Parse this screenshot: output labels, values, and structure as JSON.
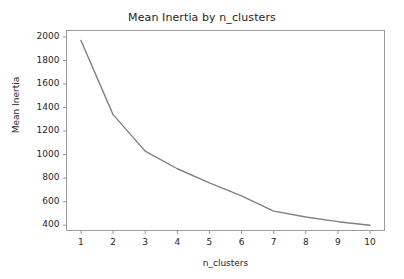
{
  "chart_data": {
    "type": "line",
    "title": "Mean Inertia by n_clusters",
    "xlabel": "n_clusters",
    "ylabel": "Mean Inertia",
    "x": [
      1,
      2,
      3,
      4,
      5,
      6,
      7,
      8,
      9,
      10
    ],
    "values": [
      1970,
      1340,
      1030,
      880,
      760,
      650,
      520,
      470,
      430,
      400
    ],
    "categories": [
      "1",
      "2",
      "3",
      "4",
      "5",
      "6",
      "7",
      "8",
      "9",
      "10"
    ],
    "series": [
      {
        "name": "Mean Inertia",
        "values": [
          1970,
          1340,
          1030,
          880,
          760,
          650,
          520,
          470,
          430,
          400
        ],
        "color": "#808080"
      }
    ],
    "xlim": [
      0.55,
      10.45
    ],
    "ylim": [
      355,
      2055
    ],
    "xticks": [
      1,
      2,
      3,
      4,
      5,
      6,
      7,
      8,
      9,
      10
    ],
    "xtick_labels": [
      "1",
      "2",
      "3",
      "4",
      "5",
      "6",
      "7",
      "8",
      "9",
      "10"
    ],
    "yticks": [
      400,
      600,
      800,
      1000,
      1200,
      1400,
      1600,
      1800,
      2000
    ],
    "ytick_labels": [
      "400",
      "600",
      "800",
      "1000",
      "1200",
      "1400",
      "1600",
      "1800",
      "2000"
    ],
    "grid": false,
    "legend": null,
    "legend_position": "none",
    "line_color": "#808080",
    "line_width": 1.4,
    "axes_color": "#9a9a9a",
    "background_color": "#ffffff",
    "text_color": "#262626",
    "markers": false
  }
}
